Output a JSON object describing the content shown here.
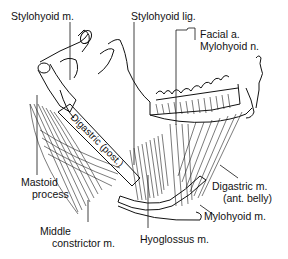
{
  "figure": {
    "type": "anatomical-illustration",
    "labels": {
      "stylohyoid_m": "Stylohyoid m.",
      "stylohyoid_lig": "Stylohyoid lig.",
      "facial_a": "Facial a.",
      "mylohyoid_n": "Mylohyoid n.",
      "mastoid_line1": "Mastoid",
      "mastoid_line2": "process",
      "digastric_ant_line1": "Digastric m.",
      "digastric_ant_line2": "(ant. belly)",
      "mylohyoid_m": "Mylohyoid m.",
      "middle_constrictor_line1": "Middle",
      "middle_constrictor_line2": "constrictor m.",
      "hyoglossus_m": "Hyoglossus m.",
      "digastric_post_inline": "Digastric (post.)"
    },
    "colors": {
      "ink": "#111111",
      "background": "#ffffff"
    }
  }
}
